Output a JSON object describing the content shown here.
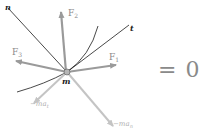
{
  "figure": {
    "labels": {
      "n": "n",
      "t": "t",
      "m": "m",
      "F1": "F",
      "F1_sub": "1",
      "F2": "F",
      "F2_sub": "2",
      "F3": "F",
      "F3_sub": "3",
      "mat": "−ma",
      "mat_sub": "t",
      "man": "−ma",
      "man_sub": "n"
    },
    "equation": "= 0",
    "colors": {
      "force_arrow": "#9a9a9a",
      "inertia_arrow": "#c4c4c4",
      "axis_line": "#1a1a1a",
      "label_dark": "#222222",
      "label_gray": "#8a8a8a",
      "label_light": "#b0b0b0"
    }
  }
}
